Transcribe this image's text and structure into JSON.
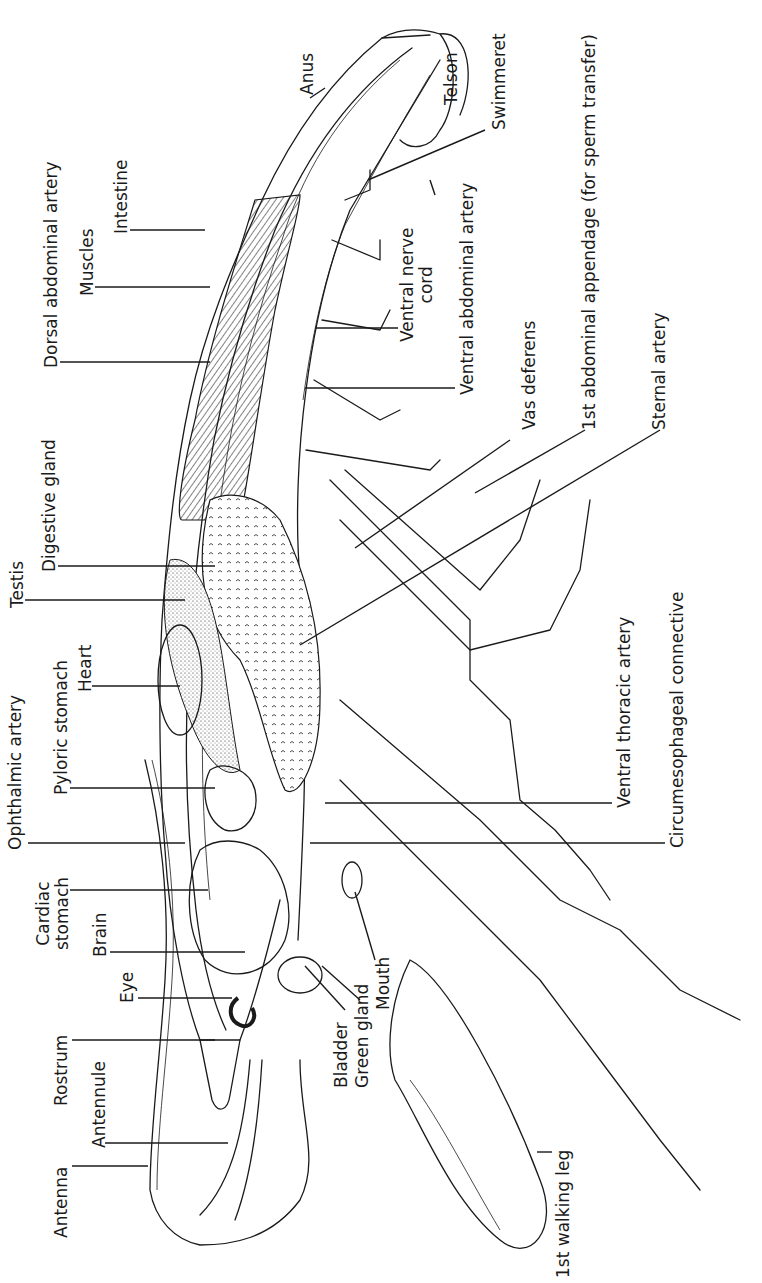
{
  "figure": {
    "orientation": "rotated 90 degrees counter-clockwise; head at bottom, tail at top"
  },
  "labels": {
    "anus": "Anus",
    "telson": "Telson",
    "swimmeret": "Swimmeret",
    "dorsal_abdominal_artery": "Dorsal abdominal artery",
    "muscles": "Muscles",
    "intestine": "Intestine",
    "ventral_nerve_cord_1": "Ventral nerve",
    "ventral_nerve_cord_2": "cord",
    "ventral_abdominal_artery": "Ventral abdominal artery",
    "vas_deferens": "Vas deferens",
    "first_abdominal_appendage": "1st abdominal appendage (for sperm transfer)",
    "sternal_artery": "Sternal artery",
    "digestive_gland": "Digestive gland",
    "testis": "Testis",
    "heart": "Heart",
    "pyloric_stomach": "Pyloric stomach",
    "ophthalmic_artery": "Ophthalmic artery",
    "ventral_thoracic_artery": "Ventral thoracic artery",
    "circumesophageal_connective": "Circumesophageal connective",
    "cardiac_stomach_1": "Cardiac",
    "cardiac_stomach_2": "stomach",
    "brain": "Brain",
    "eye": "Eye",
    "rostrum": "Rostrum",
    "antennule": "Antennule",
    "antenna": "Antenna",
    "bladder": "Bladder",
    "green_gland": "Green gland",
    "mouth": "Mouth",
    "first_walking_leg": "1st walking leg"
  },
  "colors": {
    "ink": "#1a1a1a",
    "background": "#ffffff"
  }
}
